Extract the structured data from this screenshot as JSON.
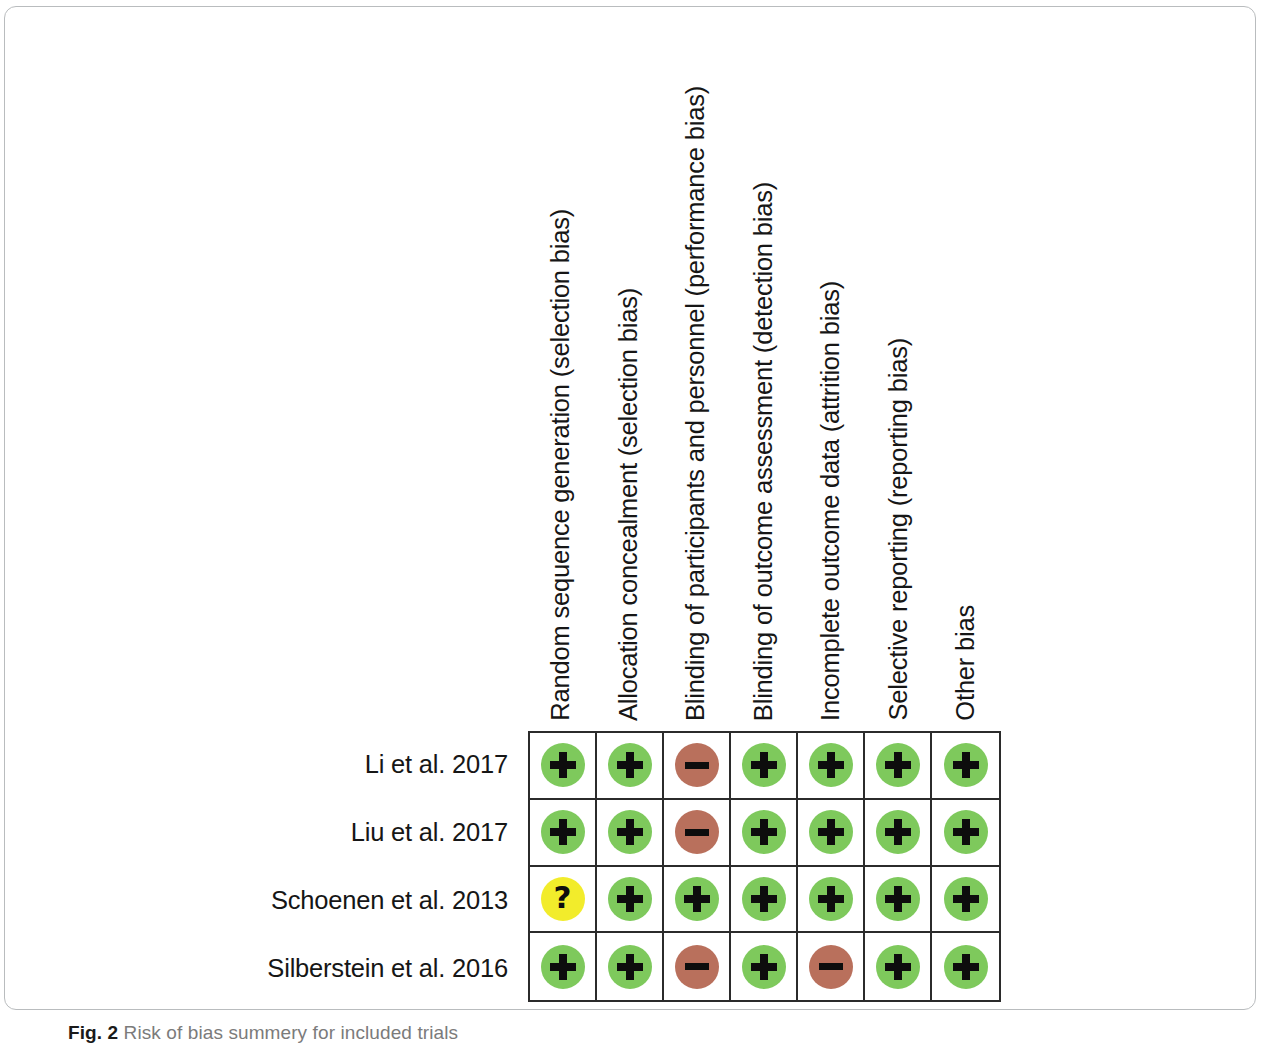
{
  "figure": {
    "caption_label": "Fig. 2",
    "caption_text": "Risk of bias summery for included trials"
  },
  "chart_data": {
    "type": "table",
    "title": "Risk of bias summery for included trials",
    "xlabel": "",
    "ylabel": "",
    "legend": [],
    "categories": [
      "Random sequence generation (selection bias)",
      "Allocation concealment (selection bias)",
      "Blinding of participants and personnel (performance bias)",
      "Blinding of outcome assessment (detection bias)",
      "Incomplete outcome data (attrition bias)",
      "Selective reporting (reporting bias)",
      "Other bias"
    ],
    "rows": [
      {
        "study": "Li et al. 2017",
        "judgements": [
          "low",
          "low",
          "high",
          "low",
          "low",
          "low",
          "low"
        ]
      },
      {
        "study": "Liu et al. 2017",
        "judgements": [
          "low",
          "low",
          "high",
          "low",
          "low",
          "low",
          "low"
        ]
      },
      {
        "study": "Schoenen et al. 2013",
        "judgements": [
          "unclear",
          "low",
          "low",
          "low",
          "low",
          "low",
          "low"
        ]
      },
      {
        "study": "Silberstein et al. 2016",
        "judgements": [
          "low",
          "low",
          "high",
          "low",
          "high",
          "low",
          "low"
        ]
      }
    ],
    "judgement_symbols": {
      "low": "+",
      "high": "–",
      "unclear": "?"
    },
    "judgement_colors": {
      "low": "#7ec95c",
      "high": "#b9705c",
      "unclear": "#f2ec2b"
    },
    "judgement_labels": {
      "low": "Low risk of bias",
      "high": "High risk of bias",
      "unclear": "Unclear risk of bias"
    }
  }
}
